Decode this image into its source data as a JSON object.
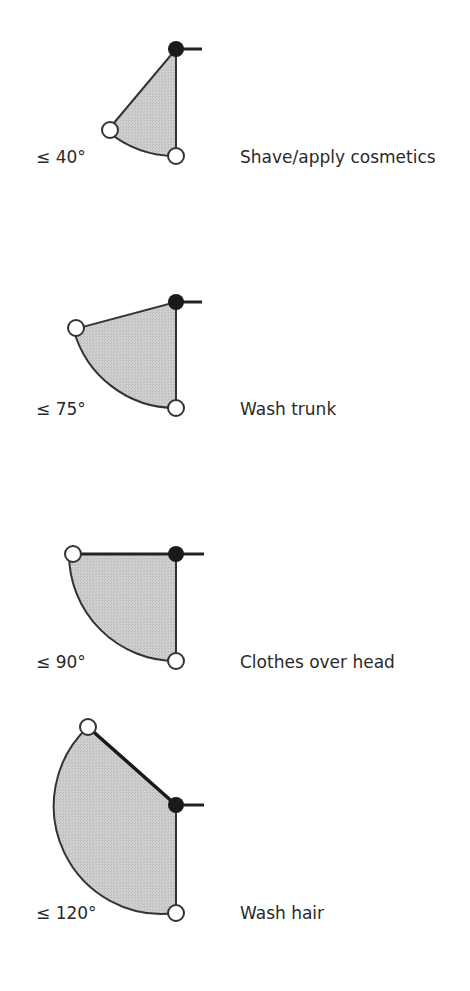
{
  "colors": {
    "sector_fill": "#c9c9c9",
    "outline": "#333333",
    "pivot_joint": "#1a1a1a",
    "end_joint": "#ffffff"
  },
  "diagrams": [
    {
      "angle_label": "≤ 40°",
      "activity": "Shave/apply cosmetics",
      "angle_deg": 40
    },
    {
      "angle_label": "≤ 75°",
      "activity": "Wash trunk",
      "angle_deg": 75
    },
    {
      "angle_label": "≤ 90°",
      "activity": "Clothes over head",
      "angle_deg": 90
    },
    {
      "angle_label": "≤ 120°",
      "activity": "Wash hair",
      "angle_deg": 120
    }
  ]
}
